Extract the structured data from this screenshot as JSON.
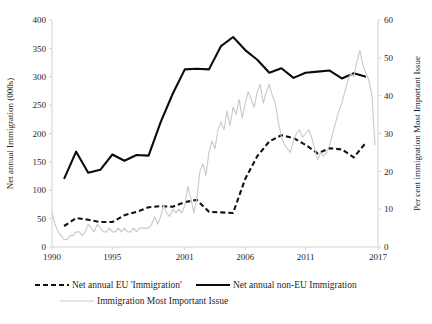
{
  "chart_data": {
    "type": "line",
    "title": "",
    "xlabel": "",
    "ylabel": "Net annual Immigration (000s)",
    "y2label": "Per cent immigration Most Important Issue",
    "xlim": [
      1990,
      2017
    ],
    "ylim": [
      0,
      400
    ],
    "y2lim": [
      0,
      60
    ],
    "grid": false,
    "legend_position": "bottom",
    "xticks": [
      "1990",
      "1995",
      "2001",
      "2006",
      "2011",
      "2017"
    ],
    "xtick_values": [
      1990,
      1995,
      2001,
      2006,
      2011,
      2017
    ],
    "yticks": [
      "0",
      "50",
      "100",
      "150",
      "200",
      "250",
      "300",
      "350",
      "400"
    ],
    "ytick_values": [
      0,
      50,
      100,
      150,
      200,
      250,
      300,
      350,
      400
    ],
    "y2ticks": [
      "0",
      "10",
      "20",
      "30",
      "40",
      "50",
      "60"
    ],
    "y2tick_values": [
      0,
      10,
      20,
      30,
      40,
      50,
      60
    ],
    "series": [
      {
        "name": "Net annual EU 'Immigration'",
        "style": "dashed",
        "color": "#111111",
        "axis": "left",
        "x": [
          1991,
          1992,
          1993,
          1994,
          1995,
          1996,
          1997,
          1998,
          1999,
          2000,
          2001,
          2002,
          2003,
          2004,
          2005,
          2006,
          2007,
          2008,
          2009,
          2010,
          2011,
          2012,
          2013,
          2014,
          2015,
          2016
        ],
        "values": [
          37,
          51,
          48,
          44,
          44,
          56,
          62,
          70,
          72,
          71,
          79,
          83,
          62,
          61,
          60,
          120,
          160,
          186,
          197,
          192,
          180,
          165,
          174,
          172,
          158,
          184
        ]
      },
      {
        "name": "Net annual non-EU Immigration",
        "style": "solid",
        "color": "#0b0b0b",
        "axis": "left",
        "x": [
          1991,
          1992,
          1993,
          1994,
          1995,
          1996,
          1997,
          1998,
          1999,
          2000,
          2001,
          2002,
          2003,
          2004,
          2005,
          2006,
          2007,
          2008,
          2009,
          2010,
          2011,
          2012,
          2013,
          2014,
          2015,
          2016
        ],
        "values": [
          120,
          168,
          131,
          136,
          163,
          152,
          162,
          161,
          220,
          270,
          313,
          314,
          313,
          354,
          370,
          347,
          330,
          307,
          315,
          298,
          307,
          309,
          311,
          297,
          306,
          300
        ]
      },
      {
        "name": "Immigration Most Important Issue",
        "style": "solid-light",
        "color": "#c9c9c9",
        "axis": "right",
        "x": [
          1990.0,
          1990.25,
          1990.5,
          1990.75,
          1991.0,
          1991.25,
          1991.5,
          1991.75,
          1992.0,
          1992.25,
          1992.5,
          1992.75,
          1993.0,
          1993.25,
          1993.5,
          1993.75,
          1994.0,
          1994.25,
          1994.5,
          1994.75,
          1995.0,
          1995.25,
          1995.5,
          1995.75,
          1996.0,
          1996.25,
          1996.5,
          1996.75,
          1997.0,
          1997.25,
          1997.5,
          1997.75,
          1998.0,
          1998.25,
          1998.5,
          1998.75,
          1999.0,
          1999.25,
          1999.5,
          1999.75,
          2000.0,
          2000.25,
          2000.5,
          2000.75,
          2001.0,
          2001.25,
          2001.5,
          2001.75,
          2002.0,
          2002.25,
          2002.5,
          2002.75,
          2003.0,
          2003.25,
          2003.5,
          2003.75,
          2004.0,
          2004.25,
          2004.5,
          2004.75,
          2005.0,
          2005.25,
          2005.5,
          2005.75,
          2006.0,
          2006.25,
          2006.5,
          2006.75,
          2007.0,
          2007.25,
          2007.5,
          2007.75,
          2008.0,
          2008.25,
          2008.5,
          2008.75,
          2009.0,
          2009.25,
          2009.5,
          2009.75,
          2010.0,
          2010.25,
          2010.5,
          2010.75,
          2011.0,
          2011.25,
          2011.5,
          2011.75,
          2012.0,
          2012.25,
          2012.5,
          2012.75,
          2013.0,
          2013.25,
          2013.5,
          2013.75,
          2014.0,
          2014.25,
          2014.5,
          2014.75,
          2015.0,
          2015.25,
          2015.5,
          2015.75,
          2016.0,
          2016.25,
          2016.5,
          2016.75
        ],
        "values": [
          9,
          6,
          4,
          3,
          2,
          2,
          3,
          3,
          4,
          4,
          3,
          4,
          6,
          5,
          4,
          6,
          5,
          4,
          4,
          5,
          4,
          4,
          5,
          4,
          5,
          4,
          4,
          5,
          4,
          5,
          5,
          5,
          5,
          6,
          8,
          6,
          8,
          11,
          9,
          8,
          10,
          9,
          10,
          9,
          11,
          16,
          13,
          9,
          13,
          20,
          22,
          19,
          25,
          28,
          26,
          31,
          33,
          31,
          36,
          32,
          37,
          35,
          39,
          34,
          38,
          41,
          39,
          37,
          41,
          43,
          38,
          41,
          43,
          40,
          38,
          33,
          29,
          27,
          26,
          25,
          28,
          30,
          31,
          29,
          30,
          31,
          29,
          26,
          23,
          25,
          24,
          25,
          27,
          30,
          33,
          36,
          38,
          41,
          44,
          46,
          45,
          49,
          52,
          48,
          46,
          44,
          40,
          27
        ]
      }
    ]
  },
  "legend": {
    "items": [
      {
        "label": "Net annual EU 'Immigration'",
        "style": "dashed",
        "color": "#111111"
      },
      {
        "label": "Net annual non-EU Immigration",
        "style": "solid",
        "color": "#0b0b0b"
      },
      {
        "label": "Immigration Most Important Issue",
        "style": "solid-light",
        "color": "#c9c9c9"
      }
    ]
  },
  "axes": {
    "left_title": "Net annual Immigration (000s)",
    "right_title": "Per cent immigration Most Important Issue"
  }
}
